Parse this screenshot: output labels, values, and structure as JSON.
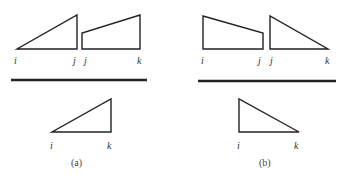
{
  "panels": [
    {
      "id": "a",
      "caption": "(a)",
      "top_shapes": [
        {
          "type": "triangle",
          "labels": [
            "i",
            "j"
          ],
          "slope": "rising"
        },
        {
          "type": "trapezoid",
          "labels": [
            "j",
            "k"
          ],
          "slope": "rising"
        }
      ],
      "bottom_shape": {
        "type": "triangle",
        "labels": [
          "i",
          "k"
        ],
        "slope": "rising"
      },
      "labels": {
        "t1_left": "i",
        "t1_right": "j",
        "t2_left": "j",
        "t2_right": "k",
        "b_left": "i",
        "b_right": "k"
      }
    },
    {
      "id": "b",
      "caption": "(b)",
      "top_shapes": [
        {
          "type": "trapezoid",
          "labels": [
            "i",
            "j"
          ],
          "slope": "falling"
        },
        {
          "type": "triangle",
          "labels": [
            "j",
            "k"
          ],
          "slope": "falling"
        }
      ],
      "bottom_shape": {
        "type": "triangle",
        "labels": [
          "i",
          "k"
        ],
        "slope": "falling"
      },
      "labels": {
        "t1_left": "i",
        "t1_right": "j",
        "t2_left": "j",
        "t2_right": "k",
        "b_left": "i",
        "b_right": "k"
      }
    }
  ],
  "colors": {
    "stroke": "#222222",
    "background": "#ffffff"
  }
}
